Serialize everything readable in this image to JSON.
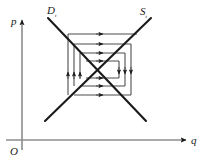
{
  "figure": {
    "background_color": "#ffffff",
    "line_color": "#1a1a1a",
    "cobweb_color": "#4d4d4d",
    "axes": {
      "vertical_label": "p",
      "horizontal_label": "q",
      "origin_label": "O",
      "vertical_axis_name": "price-axis",
      "horizontal_axis_name": "quantity-axis"
    },
    "curves": [
      {
        "name": "demand-curve",
        "label": "D",
        "subscript": "t",
        "slope": "negative",
        "x1": 48,
        "y1": 18,
        "x2": 146,
        "y2": 121
      },
      {
        "name": "supply-curve",
        "label": "S",
        "subscript": "t",
        "slope": "positive",
        "x1": 45,
        "y1": 121,
        "x2": 151,
        "y2": 18
      }
    ],
    "equilibrium": {
      "x": 97,
      "y": 69
    },
    "cobweb": {
      "description": "Outward (divergent) spiral of alternating horizontal and vertical segments between the supply and demand curves",
      "horizontal_arrow_direction": "right",
      "left_vertical_arrow_direction": "up",
      "right_vertical_arrow_direction": "down",
      "segments": [
        {
          "type": "horizontal",
          "x1": 68,
          "x2": 137,
          "y": 34,
          "arrow_at": 103,
          "dir": "right"
        },
        {
          "type": "horizontal",
          "x1": 74,
          "x2": 131,
          "y": 44,
          "arrow_at": 103,
          "dir": "right"
        },
        {
          "type": "horizontal",
          "x1": 80,
          "x2": 125,
          "y": 53,
          "arrow_at": 103,
          "dir": "right"
        },
        {
          "type": "horizontal",
          "x1": 86,
          "x2": 119,
          "y": 61,
          "arrow_at": 103,
          "dir": "right"
        },
        {
          "type": "horizontal",
          "x1": 86,
          "x2": 119,
          "y": 78,
          "arrow_at": 103,
          "dir": "right"
        },
        {
          "type": "horizontal",
          "x1": 80,
          "x2": 125,
          "y": 86,
          "arrow_at": 103,
          "dir": "right"
        },
        {
          "type": "horizontal",
          "x1": 74,
          "x2": 131,
          "y": 95,
          "arrow_at": 103,
          "dir": "right"
        },
        {
          "type": "vertical",
          "y1": 95,
          "y2": 34,
          "x": 68,
          "arrow_at": 72,
          "dir": "up"
        },
        {
          "type": "vertical",
          "y1": 86,
          "y2": 44,
          "x": 74,
          "arrow_at": 72,
          "dir": "up"
        },
        {
          "type": "vertical",
          "y1": 78,
          "y2": 53,
          "x": 80,
          "arrow_at": 72,
          "dir": "up"
        },
        {
          "type": "vertical",
          "y1": 61,
          "y2": 78,
          "x": 119,
          "arrow_at": 74,
          "dir": "down"
        },
        {
          "type": "vertical",
          "y1": 53,
          "y2": 86,
          "x": 125,
          "arrow_at": 74,
          "dir": "down"
        },
        {
          "type": "vertical",
          "y1": 44,
          "y2": 95,
          "x": 131,
          "arrow_at": 74,
          "dir": "down"
        }
      ]
    }
  }
}
